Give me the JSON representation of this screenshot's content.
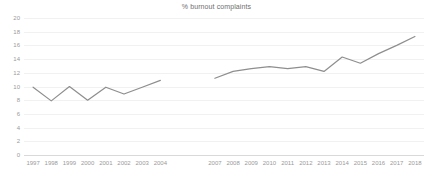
{
  "chart_data": {
    "type": "line",
    "title": "% burnout complaints",
    "xlabel": "",
    "ylabel": "",
    "ylim": [
      0,
      20
    ],
    "ytick_step": 2,
    "yticks": [
      "20",
      "18",
      "16",
      "14",
      "12",
      "10",
      "8",
      "6",
      "4",
      "2",
      "0"
    ],
    "grid": true,
    "legend": "none",
    "line_color": "#8e8e8e",
    "grid_color": "#f1f1f1",
    "axis_color": "#d9d9d9",
    "categories": [
      "1997",
      "1998",
      "1999",
      "2000",
      "2001",
      "2002",
      "2003",
      "2004",
      "",
      "",
      "2007",
      "2008",
      "2009",
      "2010",
      "2011",
      "2012",
      "2013",
      "2014",
      "2015",
      "2016",
      "2017",
      "2018"
    ],
    "series": [
      {
        "name": "segment-1997-2004",
        "x": [
          "1997",
          "1998",
          "1999",
          "2000",
          "2001",
          "2002",
          "2003",
          "2004"
        ],
        "values": [
          9.9,
          7.9,
          10.0,
          8.0,
          9.9,
          8.9,
          9.9,
          10.9
        ]
      },
      {
        "name": "segment-2007-2018",
        "x": [
          "2007",
          "2008",
          "2009",
          "2010",
          "2011",
          "2012",
          "2013",
          "2014",
          "2015",
          "2016",
          "2017",
          "2018"
        ],
        "values": [
          11.2,
          12.2,
          12.6,
          12.9,
          12.6,
          12.9,
          12.2,
          14.3,
          13.4,
          14.8,
          16.0,
          17.3
        ]
      }
    ],
    "note": "data gap between 2004 and 2007 (years 2005, 2006 not plotted)"
  },
  "xtick_labels": [
    "1997",
    "1998",
    "1999",
    "2000",
    "2001",
    "2002",
    "2003",
    "2004",
    "2007",
    "2008",
    "2009",
    "2010",
    "2011",
    "2012",
    "2013",
    "2014",
    "2015",
    "2016",
    "2017",
    "2018"
  ]
}
